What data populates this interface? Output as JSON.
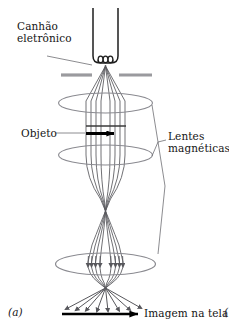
{
  "figure": {
    "panel_label": "(a)",
    "next_panel_partial": "(",
    "caption_title": "Microscópio eletrônico de transmissão",
    "background_color": "#ffffff"
  },
  "labels": {
    "electron_gun": "Canhão\neletrônico",
    "object": "Objeto",
    "magnetic_lenses": "Lentes\nmagnéticas",
    "screen_image": "Imagem na tela"
  },
  "colors": {
    "outline": "#1e1e1e",
    "beam": "#57575c",
    "lens_ellipse": "#8a8a90",
    "anode_plate": "#9a9a9e",
    "leader_line": "#6e6e73",
    "object_arrow": "#000000",
    "image_arrow": "#000000",
    "text": "#141414"
  },
  "geometry": {
    "gun": {
      "left_wall_x": 93,
      "right_wall_x": 118,
      "top_y": 8,
      "bottom_y": 63,
      "filament_coils": 3,
      "source_point": [
        105.5,
        68
      ]
    },
    "anode_plates": [
      {
        "x1": 61,
        "x2": 93,
        "y": 75
      },
      {
        "x1": 118,
        "x2": 152,
        "y": 75
      }
    ],
    "lenses": [
      {
        "name": "condenser-lens",
        "cx": 105.5,
        "cy": 103,
        "rx": 47,
        "ry": 10
      },
      {
        "name": "objective-lens",
        "cx": 105.5,
        "cy": 155,
        "rx": 47,
        "ry": 10
      },
      {
        "name": "projector-lens",
        "cx": 105.5,
        "cy": 264,
        "rx": 50,
        "ry": 11
      }
    ],
    "crossovers": [
      [
        105.5,
        211
      ],
      [
        105.5,
        288
      ]
    ],
    "object_marker": {
      "x": 88,
      "y": 133,
      "width": 32,
      "arrow": "right"
    },
    "screen_arrow": {
      "x1": 62,
      "x2": 142,
      "y": 314
    },
    "beam_ray_count": 8,
    "leader_lines": {
      "gun": [
        [
          46,
          58
        ],
        [
          93,
          64
        ]
      ],
      "object": [
        [
          56,
          133
        ],
        [
          86,
          133
        ]
      ],
      "lenses_vertex": [
        158,
        142
      ],
      "lenses_targets": [
        [
          152,
          104
        ],
        [
          152,
          156
        ],
        [
          160,
          266
        ]
      ]
    }
  },
  "legend": {
    "beam_description": "electron-beam-rays",
    "diagram_type": "transmission-electron-microscope-schematic"
  }
}
